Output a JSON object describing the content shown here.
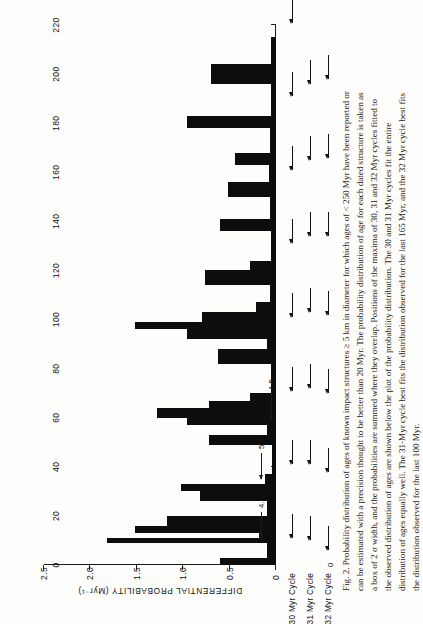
{
  "figure": {
    "label": "Fig. 2.",
    "caption_lines": [
      "Fig. 2.   Probability distribution of ages of known impact structures ≥ 5 km in diameter for which ages of < 250 Myr have been reported or",
      "can be estimated with a precision thought to be better than 20 Myr. The probability distribution of age for each dated structure is taken as",
      "a box of 2 σ width, and the probabilities are summed where they overlap. Positions of the maxima of 30, 31 and 32 Myr cycles fitted to",
      "the observed distribution of ages are shown below the plot of the probability distribution.  The 30 and 31  Myr cycles fit the entire",
      "distribution of ages equally well. The 31-Myr cycle best fits the distribution observed for the last 165 Myr, and the 32 Myr cycle best fits",
      "the distribution observed for the last 100 Myr."
    ]
  },
  "chart_data": {
    "type": "bar",
    "title": "",
    "xlabel": "",
    "ylabel": "DIFFERENTIAL PROBABILITY (Myr⁻¹)",
    "xlim": [
      0,
      220
    ],
    "ylim": [
      0,
      2.5
    ],
    "xticks": [
      0,
      20,
      40,
      60,
      80,
      100,
      120,
      140,
      160,
      180,
      200,
      220
    ],
    "xticklabels": [
      "0",
      "20",
      "40",
      "60",
      "80",
      "100",
      "120",
      "140",
      "160",
      "180",
      "200",
      "220"
    ],
    "yticks": [
      0,
      0.5,
      1.0,
      1.5,
      2.0,
      2.5
    ],
    "yticklabels": [
      "0",
      "0.5",
      "1.0",
      "1.5",
      "2.0",
      "2.5"
    ],
    "grid": false,
    "legend": "none",
    "bar_units": "Myr",
    "bars": [
      {
        "x0": 0,
        "x1": 3,
        "y": 0.6
      },
      {
        "x0": 3,
        "x1": 9,
        "y": 0.1
      },
      {
        "x0": 9,
        "x1": 11,
        "y": 1.82
      },
      {
        "x0": 11,
        "x1": 13,
        "y": 0.18
      },
      {
        "x0": 13,
        "x1": 16,
        "y": 1.52
      },
      {
        "x0": 16,
        "x1": 20,
        "y": 1.18
      },
      {
        "x0": 20,
        "x1": 26,
        "y": 0.1
      },
      {
        "x0": 26,
        "x1": 30,
        "y": 0.82
      },
      {
        "x0": 30,
        "x1": 33,
        "y": 1.02
      },
      {
        "x0": 33,
        "x1": 37,
        "y": 0.12
      },
      {
        "x0": 37,
        "x1": 49,
        "y": 0.04
      },
      {
        "x0": 49,
        "x1": 53,
        "y": 0.72
      },
      {
        "x0": 53,
        "x1": 57,
        "y": 0.1
      },
      {
        "x0": 57,
        "x1": 60,
        "y": 0.96
      },
      {
        "x0": 60,
        "x1": 64,
        "y": 1.28
      },
      {
        "x0": 64,
        "x1": 67,
        "y": 0.72
      },
      {
        "x0": 67,
        "x1": 70,
        "y": 0.28
      },
      {
        "x0": 70,
        "x1": 82,
        "y": 0.05
      },
      {
        "x0": 82,
        "x1": 88,
        "y": 0.62
      },
      {
        "x0": 88,
        "x1": 92,
        "y": 0.1
      },
      {
        "x0": 92,
        "x1": 96,
        "y": 0.96
      },
      {
        "x0": 96,
        "x1": 99,
        "y": 1.52
      },
      {
        "x0": 99,
        "x1": 103,
        "y": 0.8
      },
      {
        "x0": 103,
        "x1": 107,
        "y": 0.22
      },
      {
        "x0": 107,
        "x1": 114,
        "y": 0.06
      },
      {
        "x0": 114,
        "x1": 120,
        "y": 0.76
      },
      {
        "x0": 120,
        "x1": 124,
        "y": 0.28
      },
      {
        "x0": 124,
        "x1": 136,
        "y": 0.05
      },
      {
        "x0": 136,
        "x1": 141,
        "y": 0.6
      },
      {
        "x0": 141,
        "x1": 150,
        "y": 0.06
      },
      {
        "x0": 150,
        "x1": 156,
        "y": 0.52
      },
      {
        "x0": 156,
        "x1": 163,
        "y": 0.08
      },
      {
        "x0": 163,
        "x1": 168,
        "y": 0.44
      },
      {
        "x0": 168,
        "x1": 178,
        "y": 0.06
      },
      {
        "x0": 178,
        "x1": 183,
        "y": 0.96
      },
      {
        "x0": 183,
        "x1": 196,
        "y": 0.05
      },
      {
        "x0": 196,
        "x1": 204,
        "y": 0.7
      },
      {
        "x0": 204,
        "x1": 215,
        "y": 0.05
      }
    ],
    "annotations": [
      {
        "text": "4.5",
        "x": 11,
        "row": "upper"
      },
      {
        "text": "5.2",
        "x": 35,
        "row": "upper"
      },
      {
        "text": "4.5",
        "x": 59,
        "row": "lower"
      }
    ],
    "cycles": [
      {
        "label": "30 Myr Cycle",
        "maxima": [
          11,
          41,
          71,
          101,
          131,
          161,
          191,
          221
        ]
      },
      {
        "label": "31 Myr Cycle",
        "maxima": [
          10,
          41,
          72,
          103,
          134,
          165,
          196
        ]
      },
      {
        "label": "32 Myr Cycle",
        "maxima": [
          6,
          38,
          70,
          102,
          134,
          166,
          198
        ]
      }
    ],
    "cycle_origin_label": "0"
  }
}
